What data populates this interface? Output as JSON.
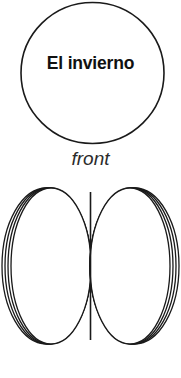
{
  "document": {
    "title": "El invierno folded card layout",
    "background_color": "#ffffff",
    "stroke_color": "#1a1a1a",
    "text_color": "#111111"
  },
  "front_panel": {
    "shape": "circle",
    "card_text": "El invierno",
    "caption": "front"
  },
  "inside_panel": {
    "shape": "two-ellipses",
    "caption": "inside",
    "fold_line": "center-vertical"
  }
}
